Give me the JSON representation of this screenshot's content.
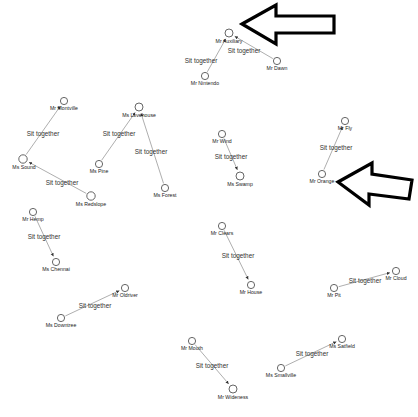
{
  "canvas": {
    "width": 418,
    "height": 417,
    "background": "#ffffff",
    "node_fill": "#ffffff",
    "node_stroke": "#555555",
    "edge_color": "#999999",
    "label_color": "#222222",
    "annotation_color": "#000000"
  },
  "edge_relation_label": "Sit together",
  "nodes": [
    {
      "id": "auxiliary",
      "label": "Mr Auxiliary",
      "x": 229,
      "y": 33,
      "r": 4.0,
      "label_dx": 0,
      "label_dy": 9
    },
    {
      "id": "dawn",
      "label": "Mr Dawn",
      "x": 277,
      "y": 61,
      "r": 3.6,
      "label_dx": 0,
      "label_dy": 8
    },
    {
      "id": "nintendo",
      "label": "Mr Nintendo",
      "x": 205,
      "y": 76,
      "r": 3.6,
      "label_dx": 0,
      "label_dy": 8
    },
    {
      "id": "montville",
      "label": "Mr Montville",
      "x": 64,
      "y": 101,
      "r": 3.6,
      "label_dx": 0,
      "label_dy": 8
    },
    {
      "id": "lovehouse",
      "label": "Ms Lovehouse",
      "x": 139,
      "y": 107,
      "r": 4.0,
      "label_dx": 0,
      "label_dy": 9
    },
    {
      "id": "fly",
      "label": "Mr Fly",
      "x": 345,
      "y": 121,
      "r": 3.6,
      "label_dx": 0,
      "label_dy": 8
    },
    {
      "id": "wind",
      "label": "Mr Wind",
      "x": 222,
      "y": 134,
      "r": 3.6,
      "label_dx": 0,
      "label_dy": 8
    },
    {
      "id": "sound",
      "label": "Ms Sound",
      "x": 23,
      "y": 159,
      "r": 4.2,
      "label_dx": 1,
      "label_dy": 9
    },
    {
      "id": "pine",
      "label": "Ms Pine",
      "x": 99,
      "y": 164,
      "r": 3.6,
      "label_dx": 0,
      "label_dy": 8
    },
    {
      "id": "orange",
      "label": "Mr Orange",
      "x": 322,
      "y": 174,
      "r": 3.6,
      "label_dx": 0,
      "label_dy": 8
    },
    {
      "id": "swamp",
      "label": "Ms Swamp",
      "x": 240,
      "y": 176,
      "r": 4.0,
      "label_dx": 0,
      "label_dy": 9
    },
    {
      "id": "forest",
      "label": "Ms Forest",
      "x": 165,
      "y": 188,
      "r": 3.6,
      "label_dx": 0,
      "label_dy": 8
    },
    {
      "id": "redslope",
      "label": "Ms Redslope",
      "x": 91,
      "y": 196,
      "r": 4.2,
      "label_dx": 0,
      "label_dy": 9
    },
    {
      "id": "hemp",
      "label": "Mr Hemp",
      "x": 33,
      "y": 212,
      "r": 3.6,
      "label_dx": 0,
      "label_dy": 8
    },
    {
      "id": "clears",
      "label": "Mr Clears",
      "x": 222,
      "y": 226,
      "r": 3.6,
      "label_dx": 0,
      "label_dy": 8
    },
    {
      "id": "chennai",
      "label": "Ms Chennai",
      "x": 56,
      "y": 262,
      "r": 3.6,
      "label_dx": 0,
      "label_dy": 8
    },
    {
      "id": "cloud",
      "label": "Mr Cloud",
      "x": 396,
      "y": 271,
      "r": 3.6,
      "label_dx": 0,
      "label_dy": 8
    },
    {
      "id": "house",
      "label": "Mr House",
      "x": 251,
      "y": 285,
      "r": 3.6,
      "label_dx": 0,
      "label_dy": 8
    },
    {
      "id": "oldriver",
      "label": "Mr Oldriver",
      "x": 125,
      "y": 288,
      "r": 3.6,
      "label_dx": 0,
      "label_dy": 8
    },
    {
      "id": "pit",
      "label": "Mr Pit",
      "x": 334,
      "y": 288,
      "r": 3.6,
      "label_dx": 0,
      "label_dy": 8
    },
    {
      "id": "downtree",
      "label": "Ms Downtree",
      "x": 61,
      "y": 318,
      "r": 3.6,
      "label_dx": 0,
      "label_dy": 8
    },
    {
      "id": "satfield",
      "label": "Ms Satfield",
      "x": 342,
      "y": 339,
      "r": 3.6,
      "label_dx": 0,
      "label_dy": 8
    },
    {
      "id": "mouth",
      "label": "Mr Mouth",
      "x": 192,
      "y": 341,
      "r": 3.6,
      "label_dx": 0,
      "label_dy": 8
    },
    {
      "id": "smallville",
      "label": "Ms Smallville",
      "x": 281,
      "y": 368,
      "r": 3.6,
      "label_dx": 0,
      "label_dy": 8
    },
    {
      "id": "wideness",
      "label": "Mr Wideness",
      "x": 233,
      "y": 389,
      "r": 4.0,
      "label_dx": 0,
      "label_dy": 9
    }
  ],
  "edges": [
    {
      "id": "e-nintendo-auxiliary",
      "from": "nintendo",
      "to": "auxiliary",
      "label": "Sit together",
      "label_x": 201,
      "label_y": 61
    },
    {
      "id": "e-dawn-auxiliary",
      "from": "dawn",
      "to": "auxiliary",
      "label": "Sit together",
      "label_x": 244,
      "label_y": 51
    },
    {
      "id": "e-sound-montville",
      "from": "sound",
      "to": "montville",
      "label": "Sit together",
      "label_x": 43,
      "label_y": 134
    },
    {
      "id": "e-pine-lovehouse",
      "from": "pine",
      "to": "lovehouse",
      "label": "Sit together",
      "label_x": 119,
      "label_y": 134
    },
    {
      "id": "e-forest-lovehouse",
      "from": "forest",
      "to": "lovehouse",
      "label": "Sit together",
      "label_x": 151,
      "label_y": 152
    },
    {
      "id": "e-redslope-sound",
      "from": "redslope",
      "to": "sound",
      "label": "Sit together",
      "label_x": 62,
      "label_y": 183
    },
    {
      "id": "e-wind-swamp",
      "from": "wind",
      "to": "swamp",
      "label": "Sit together",
      "label_x": 231,
      "label_y": 157
    },
    {
      "id": "e-orange-fly",
      "from": "orange",
      "to": "fly",
      "label": "Sit together",
      "label_x": 336,
      "label_y": 148
    },
    {
      "id": "e-hemp-chennai",
      "from": "hemp",
      "to": "chennai",
      "label": "Sit together",
      "label_x": 44,
      "label_y": 237
    },
    {
      "id": "e-clears-house",
      "from": "clears",
      "to": "house",
      "label": "Sit together",
      "label_x": 238,
      "label_y": 256
    },
    {
      "id": "e-pit-cloud",
      "from": "pit",
      "to": "cloud",
      "label": "Sit together",
      "label_x": 365,
      "label_y": 281
    },
    {
      "id": "e-downtree-oldriver",
      "from": "downtree",
      "to": "oldriver",
      "label": "Sit together",
      "label_x": 95,
      "label_y": 306
    },
    {
      "id": "e-mouth-wideness",
      "from": "mouth",
      "to": "wideness",
      "label": "Sit together",
      "label_x": 212,
      "label_y": 366
    },
    {
      "id": "e-smallville-satfield",
      "from": "smallville",
      "to": "satfield",
      "label": "Sit together",
      "label_x": 312,
      "label_y": 354
    }
  ],
  "annotations": [
    {
      "id": "arrow-top",
      "name": "annotation-arrow-top",
      "direction": "left",
      "points": "242,24 276,5 276,16 334,16 334,33 276,33 276,44",
      "note": "hand-drawn left-pointing arrow near Mr Auxiliary"
    },
    {
      "id": "arrow-right",
      "name": "annotation-arrow-right",
      "direction": "left",
      "points": "338,182 372,163 372,174 412,180 409,199 369,194 369,205",
      "note": "hand-drawn left-pointing arrow near Mr Orange"
    }
  ]
}
